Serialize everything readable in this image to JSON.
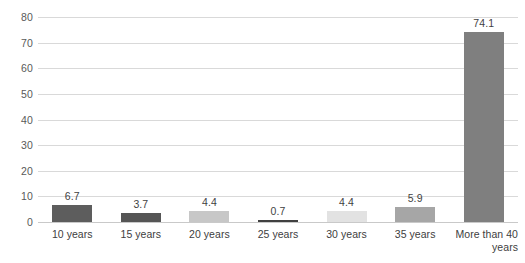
{
  "chart_data": {
    "type": "bar",
    "title": "",
    "subtitle": "",
    "xlabel": "",
    "ylabel": "",
    "categories": [
      "10 years",
      "15 years",
      "20 years",
      "25 years",
      "30 years",
      "35 years",
      "More than 40 years"
    ],
    "values": [
      6.7,
      3.7,
      4.4,
      0.7,
      4.4,
      5.9,
      74.1
    ],
    "value_labels": [
      "6.7",
      "3.7",
      "4.4",
      "0.7",
      "4.4",
      "5.9",
      "74.1"
    ],
    "bar_colors": [
      "#5d5d5d",
      "#555555",
      "#c7c7c7",
      "#404040",
      "#e2e2e2",
      "#a6a6a6",
      "#7f7f7f"
    ],
    "ylim": [
      0,
      80
    ],
    "yticks": [
      0,
      10,
      20,
      30,
      40,
      50,
      60,
      70,
      80
    ],
    "ytick_labels": [
      "0",
      "10",
      "20",
      "30",
      "40",
      "50",
      "60",
      "70",
      "80"
    ],
    "grid": true,
    "grid_color": "#d9d9d9",
    "legend": false,
    "legend_position": "none",
    "background": "#ffffff"
  }
}
